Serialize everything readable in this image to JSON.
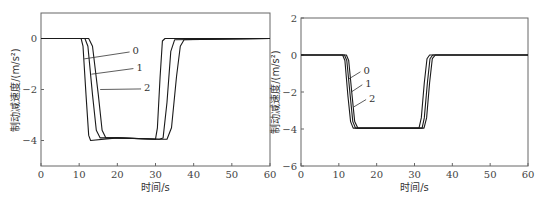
{
  "chart_data": [
    {
      "type": "line",
      "title": "",
      "xlabel": "时间/s",
      "ylabel": "制动减速度/(m/s²)",
      "xlim": [
        0,
        60
      ],
      "ylim": [
        -5,
        1
      ],
      "xticks": [
        0,
        10,
        20,
        30,
        40,
        50,
        60
      ],
      "yticks": [
        0,
        -2,
        -4
      ],
      "grid": false,
      "legend": "inline curve labels with leader lines",
      "series": [
        {
          "name": "0",
          "points": [
            [
              0,
              0
            ],
            [
              12.5,
              0
            ],
            [
              13.5,
              -0.3
            ],
            [
              15,
              -2.2
            ],
            [
              16,
              -3.6
            ],
            [
              17,
              -3.9
            ],
            [
              20,
              -3.9
            ],
            [
              31,
              -3.95
            ],
            [
              33,
              -3.95
            ],
            [
              34.2,
              -3.5
            ],
            [
              35.5,
              -1.5
            ],
            [
              36.5,
              -0.3
            ],
            [
              37.5,
              -0.05
            ],
            [
              60,
              0
            ]
          ]
        },
        {
          "name": "1",
          "points": [
            [
              0,
              0
            ],
            [
              11.5,
              0
            ],
            [
              12.3,
              -0.3
            ],
            [
              13.5,
              -2.2
            ],
            [
              14.5,
              -3.6
            ],
            [
              15.5,
              -3.9
            ],
            [
              20,
              -3.9
            ],
            [
              31,
              -3.95
            ],
            [
              32,
              -3.9
            ],
            [
              33,
              -2.5
            ],
            [
              34,
              -0.5
            ],
            [
              35,
              -0.05
            ],
            [
              60,
              0
            ]
          ]
        },
        {
          "name": "2",
          "points": [
            [
              0,
              0
            ],
            [
              10.5,
              0
            ],
            [
              11,
              -0.3
            ],
            [
              11.8,
              -2.2
            ],
            [
              12.5,
              -3.8
            ],
            [
              13,
              -4.0
            ],
            [
              20,
              -3.9
            ],
            [
              30,
              -3.95
            ],
            [
              30.5,
              -3.5
            ],
            [
              31.2,
              -1.5
            ],
            [
              31.8,
              -0.1
            ],
            [
              32.5,
              0
            ],
            [
              60,
              0
            ]
          ]
        }
      ],
      "annotations": [
        "2",
        "1",
        "0"
      ]
    },
    {
      "type": "line",
      "title": "",
      "xlabel": "时间/s",
      "ylabel": "制动减速度/(m/s²)",
      "xlim": [
        0,
        60
      ],
      "ylim": [
        -6,
        2
      ],
      "xticks": [
        0,
        10,
        20,
        30,
        40,
        50,
        60
      ],
      "yticks": [
        2,
        0,
        -2,
        -4,
        -6
      ],
      "grid": false,
      "legend": "inline curve labels with leader lines",
      "series": [
        {
          "name": "0",
          "points": [
            [
              0,
              0
            ],
            [
              12,
              0
            ],
            [
              12.6,
              -0.3
            ],
            [
              13.5,
              -2.2
            ],
            [
              14.2,
              -3.6
            ],
            [
              15,
              -3.95
            ],
            [
              20,
              -3.95
            ],
            [
              32.5,
              -3.95
            ],
            [
              33.2,
              -3.4
            ],
            [
              34,
              -1.5
            ],
            [
              34.7,
              -0.2
            ],
            [
              35.5,
              0
            ],
            [
              60,
              0
            ]
          ]
        },
        {
          "name": "1",
          "points": [
            [
              0,
              0
            ],
            [
              11.5,
              0
            ],
            [
              12.1,
              -0.3
            ],
            [
              13,
              -2.2
            ],
            [
              13.7,
              -3.6
            ],
            [
              14.4,
              -3.95
            ],
            [
              20,
              -3.95
            ],
            [
              32,
              -3.95
            ],
            [
              32.6,
              -3.4
            ],
            [
              33.4,
              -1.5
            ],
            [
              34.1,
              -0.2
            ],
            [
              34.8,
              0
            ],
            [
              60,
              0
            ]
          ]
        },
        {
          "name": "2",
          "points": [
            [
              0,
              0
            ],
            [
              11,
              0
            ],
            [
              11.6,
              -0.3
            ],
            [
              12.4,
              -2.2
            ],
            [
              13.1,
              -3.6
            ],
            [
              13.8,
              -3.95
            ],
            [
              20,
              -3.95
            ],
            [
              31.2,
              -3.95
            ],
            [
              31.8,
              -3.4
            ],
            [
              32.6,
              -1.5
            ],
            [
              33.3,
              -0.2
            ],
            [
              34,
              0
            ],
            [
              60,
              0
            ]
          ]
        }
      ],
      "annotations": [
        "2",
        "1",
        "0"
      ]
    }
  ]
}
